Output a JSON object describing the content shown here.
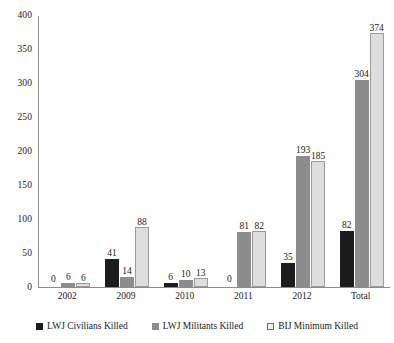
{
  "chart_data": {
    "type": "bar",
    "title": "",
    "xlabel": "",
    "ylabel": "",
    "ylim": [
      0,
      400
    ],
    "yticks": [
      0,
      50,
      100,
      150,
      200,
      250,
      300,
      350,
      400
    ],
    "ytick_labels": [
      "0",
      "50",
      "100",
      "150",
      "200",
      "250",
      "300",
      "350",
      "400"
    ],
    "grid": false,
    "legend_position": "bottom",
    "categories": [
      "2002",
      "2009",
      "2010",
      "2011",
      "2012",
      "Total"
    ],
    "series": [
      {
        "name": "LWJ Civilians Killed",
        "color": "#1c1c1c",
        "values": [
          0,
          41,
          6,
          0,
          35,
          82
        ],
        "labels": [
          "0",
          "41",
          "6",
          "0",
          "35",
          "82"
        ]
      },
      {
        "name": "LWJ Militants Killed",
        "color": "#8d8d8d",
        "values": [
          6,
          14,
          10,
          81,
          193,
          304
        ],
        "labels": [
          "6",
          "14",
          "10",
          "81",
          "193",
          "304"
        ]
      },
      {
        "name": "BIJ Minimum Killed",
        "color": "#dedede",
        "values": [
          6,
          88,
          13,
          82,
          185,
          374
        ],
        "labels": [
          "6",
          "88",
          "13",
          "82",
          "185",
          "374"
        ]
      }
    ]
  },
  "legend": {
    "items": [
      {
        "label": "LWJ Civilians Killed",
        "swatch": "black-square-icon"
      },
      {
        "label": "LWJ Militants Killed",
        "swatch": "gray-square-icon"
      },
      {
        "label": "BIJ Minimum Killed",
        "swatch": "light-square-icon"
      }
    ]
  }
}
